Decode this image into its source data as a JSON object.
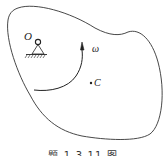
{
  "figure": {
    "labels": {
      "pivot": "O",
      "angular_velocity": "ω",
      "center_of_mass": "C"
    },
    "caption": "题 1-3-11 图",
    "colors": {
      "line": "#333333",
      "background": "#ffffff"
    }
  }
}
